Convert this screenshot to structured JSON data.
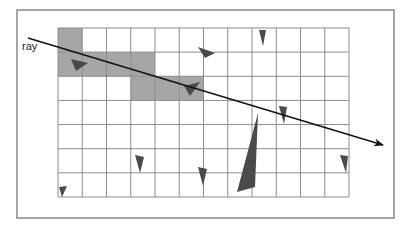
{
  "diagram": {
    "ray_label": "ray",
    "colors": {
      "background": "#ffffff",
      "frame": "#8a8a8a",
      "grid_line": "#8c8c8c",
      "shaded_cell": "#a6a6a6",
      "triangle": "#4a4a4a",
      "ray": "#111111"
    },
    "frame": {
      "x": 17,
      "y": 10,
      "width": 377,
      "height": 208
    },
    "grid": {
      "x": 58,
      "y": 28,
      "columns": 12,
      "rows": 7,
      "cell_width": 24.25,
      "cell_height": 24.14
    },
    "shaded_cells": [
      {
        "row": 0,
        "col": 0
      },
      {
        "row": 1,
        "col": 0
      },
      {
        "row": 1,
        "col": 1
      },
      {
        "row": 1,
        "col": 2
      },
      {
        "row": 1,
        "col": 3
      },
      {
        "row": 2,
        "col": 3
      },
      {
        "row": 2,
        "col": 4
      },
      {
        "row": 2,
        "col": 5
      }
    ],
    "ray": {
      "start": [
        28,
        38
      ],
      "end": [
        383,
        145
      ],
      "label_position": [
        22,
        50
      ]
    },
    "triangles": [
      {
        "points": [
          [
            71,
            59
          ],
          [
            88,
            63
          ],
          [
            76,
            71
          ]
        ]
      },
      {
        "points": [
          [
            198,
            47
          ],
          [
            215,
            53
          ],
          [
            205,
            58
          ]
        ]
      },
      {
        "points": [
          [
            259,
            30
          ],
          [
            266,
            30
          ],
          [
            263,
            46
          ]
        ]
      },
      {
        "points": [
          [
            184,
            86
          ],
          [
            200,
            82
          ],
          [
            190,
            96
          ]
        ]
      },
      {
        "points": [
          [
            279,
            106
          ],
          [
            287,
            107
          ],
          [
            284,
            124
          ]
        ]
      },
      {
        "points": [
          [
            258,
            113
          ],
          [
            255,
            187
          ],
          [
            237,
            192
          ]
        ]
      },
      {
        "points": [
          [
            135,
            155
          ],
          [
            144,
            157
          ],
          [
            140,
            173
          ]
        ]
      },
      {
        "points": [
          [
            198,
            167
          ],
          [
            207,
            169
          ],
          [
            203,
            186
          ]
        ]
      },
      {
        "points": [
          [
            340,
            155
          ],
          [
            348,
            156
          ],
          [
            346,
            173
          ]
        ]
      },
      {
        "points": [
          [
            59,
            187
          ],
          [
            67,
            186
          ],
          [
            62,
            197
          ]
        ]
      }
    ]
  }
}
